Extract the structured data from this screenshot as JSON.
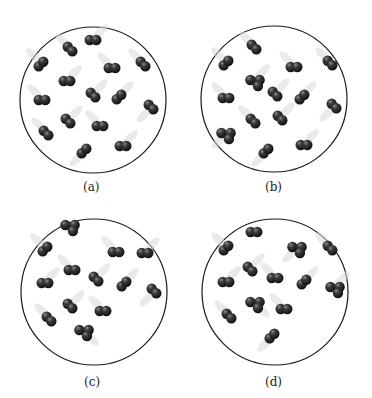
{
  "figure": {
    "panels": [
      {
        "label": "(a)",
        "molecules": [
          {
            "type": "diatomic",
            "dir": "diag-down",
            "trail": "upper-left"
          },
          {
            "type": "diatomic",
            "dir": "horizontal",
            "trail": "upper-right"
          },
          {
            "type": "diatomic",
            "dir": "diag-up",
            "trail": "upper-left"
          },
          {
            "type": "diatomic",
            "dir": "horizontal",
            "trail": "upper-left"
          },
          {
            "type": "diatomic",
            "dir": "diag-down",
            "trail": "upper-left"
          },
          {
            "type": "diatomic",
            "dir": "horizontal",
            "trail": "upper-right"
          },
          {
            "type": "diatomic",
            "dir": "horizontal",
            "trail": "upper-left"
          },
          {
            "type": "diatomic",
            "dir": "diag-down",
            "trail": "upper-right"
          },
          {
            "type": "diatomic",
            "dir": "diag-up",
            "trail": "upper-right"
          },
          {
            "type": "diatomic",
            "dir": "diag-down",
            "trail": "lower-left"
          },
          {
            "type": "diatomic",
            "dir": "diag-down",
            "trail": "upper-right"
          },
          {
            "type": "diatomic",
            "dir": "horizontal",
            "trail": "upper-left"
          },
          {
            "type": "diatomic",
            "dir": "diag-down",
            "trail": "upper-left"
          },
          {
            "type": "diatomic",
            "dir": "diag-up",
            "trail": "lower-left"
          },
          {
            "type": "diatomic",
            "dir": "horizontal",
            "trail": "upper-right"
          }
        ]
      },
      {
        "label": "(b)",
        "molecules": [
          {
            "type": "diatomic",
            "dir": "diag-down",
            "trail": "upper-left"
          },
          {
            "type": "diatomic",
            "dir": "diag-up",
            "trail": "upper-left"
          },
          {
            "type": "diatomic",
            "dir": "horizontal",
            "trail": "upper-left"
          },
          {
            "type": "diatomic",
            "dir": "diag-down",
            "trail": "upper-left"
          },
          {
            "type": "triatomic",
            "dir": "horizontal",
            "trail": "upper-right"
          },
          {
            "type": "diatomic",
            "dir": "horizontal",
            "trail": "upper-left"
          },
          {
            "type": "diatomic",
            "dir": "diag-down",
            "trail": "upper-right"
          },
          {
            "type": "diatomic",
            "dir": "diag-up",
            "trail": "upper-right"
          },
          {
            "type": "diatomic",
            "dir": "diag-down",
            "trail": "lower-left"
          },
          {
            "type": "diatomic",
            "dir": "diag-down",
            "trail": "upper-right"
          },
          {
            "type": "triatomic",
            "dir": "horizontal",
            "trail": "lower-left"
          },
          {
            "type": "diatomic",
            "dir": "diag-down",
            "trail": "upper-left"
          },
          {
            "type": "diatomic",
            "dir": "diag-up",
            "trail": "lower-left"
          },
          {
            "type": "diatomic",
            "dir": "horizontal",
            "trail": "upper-right"
          }
        ]
      },
      {
        "label": "(c)",
        "molecules": [
          {
            "type": "triatomic",
            "dir": "horizontal",
            "trail": "none"
          },
          {
            "type": "diatomic",
            "dir": "diag-up",
            "trail": "upper-left"
          },
          {
            "type": "diatomic",
            "dir": "horizontal",
            "trail": "upper-left"
          },
          {
            "type": "diatomic",
            "dir": "horizontal",
            "trail": "upper-right"
          },
          {
            "type": "diatomic",
            "dir": "horizontal",
            "trail": "upper-right"
          },
          {
            "type": "diatomic",
            "dir": "horizontal",
            "trail": "upper-left"
          },
          {
            "type": "diatomic",
            "dir": "diag-down",
            "trail": "upper-right"
          },
          {
            "type": "diatomic",
            "dir": "diag-up",
            "trail": "upper-right"
          },
          {
            "type": "diatomic",
            "dir": "diag-down",
            "trail": "lower-left"
          },
          {
            "type": "diatomic",
            "dir": "diag-down",
            "trail": "upper-right"
          },
          {
            "type": "diatomic",
            "dir": "horizontal",
            "trail": "upper-left"
          },
          {
            "type": "diatomic",
            "dir": "diag-down",
            "trail": "upper-left"
          },
          {
            "type": "triatomic",
            "dir": "horizontal",
            "trail": "lower-right"
          }
        ]
      },
      {
        "label": "(d)",
        "molecules": [
          {
            "type": "diatomic",
            "dir": "horizontal",
            "trail": "none"
          },
          {
            "type": "diatomic",
            "dir": "diag-up",
            "trail": "upper-left"
          },
          {
            "type": "triatomic",
            "dir": "horizontal",
            "trail": "lower-left"
          },
          {
            "type": "diatomic",
            "dir": "diag-down",
            "trail": "upper-left"
          },
          {
            "type": "diatomic",
            "dir": "horizontal",
            "trail": "upper-right"
          },
          {
            "type": "diatomic",
            "dir": "diag-down",
            "trail": "upper-right"
          },
          {
            "type": "diatomic",
            "dir": "horizontal",
            "trail": "upper-left"
          },
          {
            "type": "diatomic",
            "dir": "diag-up",
            "trail": "upper-right"
          },
          {
            "type": "triatomic",
            "dir": "horizontal",
            "trail": "upper-right"
          },
          {
            "type": "triatomic",
            "dir": "horizontal",
            "trail": "lower-right"
          },
          {
            "type": "diatomic",
            "dir": "diag-down",
            "trail": "upper-left"
          },
          {
            "type": "diatomic",
            "dir": "horizontal",
            "trail": "upper-left"
          },
          {
            "type": "diatomic",
            "dir": "diag-up",
            "trail": "lower-left"
          }
        ]
      }
    ]
  }
}
